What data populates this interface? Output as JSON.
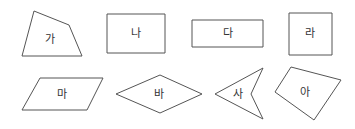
{
  "diagram": {
    "shapes": [
      {
        "id": "ga",
        "label": "가",
        "type": "quadrilateral",
        "points": "34,11 69,25 82,56 22,56",
        "label_pos": [
          50,
          40
        ]
      },
      {
        "id": "na",
        "label": "나",
        "type": "rectangle",
        "points": "107,14 165,14 165,53 107,53",
        "label_pos": [
          136,
          34
        ]
      },
      {
        "id": "da",
        "label": "다",
        "type": "rectangle",
        "points": "192,20 263,20 263,47 192,47",
        "label_pos": [
          228,
          34
        ]
      },
      {
        "id": "ra",
        "label": "라",
        "type": "square",
        "points": "289,13 332,13 332,55 289,55",
        "label_pos": [
          310,
          34
        ]
      },
      {
        "id": "ma",
        "label": "마",
        "type": "parallelogram",
        "points": "40,78 103,78 87,110 22,110",
        "label_pos": [
          62,
          95
        ]
      },
      {
        "id": "ba",
        "label": "바",
        "type": "rhombus",
        "points": "116,94 160,75 202,94 160,113",
        "label_pos": [
          159,
          95
        ]
      },
      {
        "id": "sa",
        "label": "사",
        "type": "concave-quadrilateral",
        "points": "215,94 263,68 251,94 263,119",
        "label_pos": [
          238,
          95
        ]
      },
      {
        "id": "a",
        "label": "아",
        "type": "quadrilateral",
        "points": "291,67 341,80 314,120 275,92",
        "label_pos": [
          305,
          93
        ]
      }
    ],
    "stroke_color": "#555555",
    "text_color": "#333333"
  }
}
